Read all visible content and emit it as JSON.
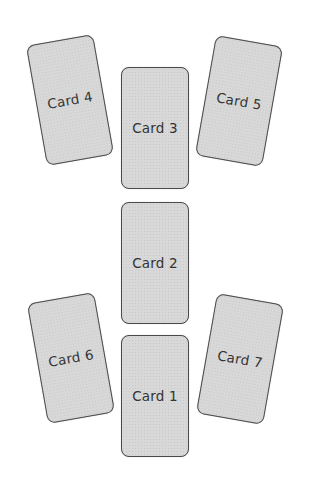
{
  "layout": "tarot-spread",
  "cards": [
    {
      "label": "Card 1",
      "cx": 155,
      "cy": 396,
      "rotate": 0
    },
    {
      "label": "Card 2",
      "cx": 155,
      "cy": 263,
      "rotate": 0
    },
    {
      "label": "Card 3",
      "cx": 155,
      "cy": 128,
      "rotate": 0
    },
    {
      "label": "Card 4",
      "cx": 70,
      "cy": 100,
      "rotate": -10
    },
    {
      "label": "Card 5",
      "cx": 239,
      "cy": 101,
      "rotate": 10
    },
    {
      "label": "Card 6",
      "cx": 71,
      "cy": 358,
      "rotate": -10
    },
    {
      "label": "Card 7",
      "cx": 240,
      "cy": 359,
      "rotate": 10
    }
  ],
  "colors": {
    "card_fill": "#d8d8d8",
    "card_border": "#4a4a4a",
    "text": "#333333",
    "background": "#ffffff"
  }
}
